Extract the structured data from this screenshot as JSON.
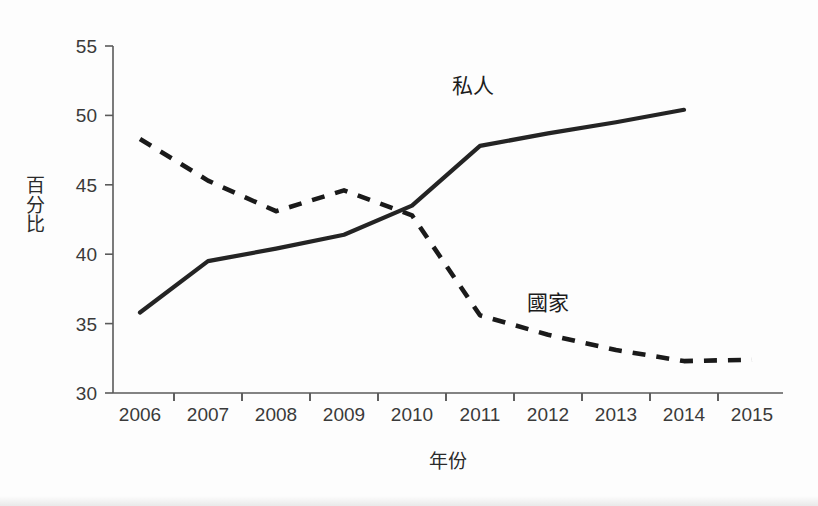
{
  "chart_data": {
    "type": "line",
    "title": "",
    "xlabel": "年份",
    "ylabel": "百分比",
    "ylabel_chars": [
      "百",
      "分",
      "比"
    ],
    "categories": [
      "2006",
      "2007",
      "2008",
      "2009",
      "2010",
      "2011",
      "2012",
      "2013",
      "2014",
      "2015"
    ],
    "x": [
      2006,
      2007,
      2008,
      2009,
      2010,
      2011,
      2012,
      2013,
      2014,
      2015
    ],
    "xlim": [
      2005.6,
      2015.4
    ],
    "ylim": [
      30,
      55
    ],
    "y_ticks": [
      30,
      35,
      40,
      45,
      50,
      55
    ],
    "x_ticks": [
      "2006",
      "2007",
      "2008",
      "2009",
      "2010",
      "2011",
      "2012",
      "2013",
      "2014",
      "2015"
    ],
    "grid": false,
    "legend": "inline-annotations",
    "series": [
      {
        "name": "私人",
        "style": "solid",
        "color": "#242424",
        "x": [
          2006,
          2007,
          2008,
          2009,
          2010,
          2011,
          2012,
          2013,
          2014
        ],
        "values": [
          35.8,
          39.5,
          40.4,
          41.4,
          43.5,
          47.8,
          48.7,
          49.5,
          50.4
        ],
        "label": "私人",
        "label_x": 2010.9,
        "label_y": 51.6
      },
      {
        "name": "國家",
        "style": "dashed",
        "color": "#1a1a1a",
        "x": [
          2006,
          2007,
          2008,
          2009,
          2010,
          2011,
          2012,
          2013,
          2014,
          2015
        ],
        "values": [
          48.3,
          45.3,
          43.1,
          44.6,
          42.8,
          35.6,
          34.2,
          33.1,
          32.3,
          32.4
        ],
        "label": "國家",
        "label_x": 2012.0,
        "label_y": 36.0
      }
    ],
    "annotations": [
      {
        "text": "私人",
        "series": "私人"
      },
      {
        "text": "國家",
        "series": "國家"
      }
    ]
  },
  "colors": {
    "background": "#fdfdfd",
    "axis": "#5a5a5a",
    "solid_series": "#242424",
    "dashed_series": "#1a1a1a",
    "tick_text": "#3a3a3a"
  }
}
